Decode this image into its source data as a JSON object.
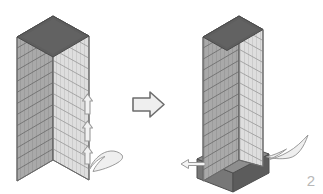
{
  "figure": {
    "label": "2",
    "label_color": "#b8b8b8",
    "background": "#ffffff",
    "title": ""
  },
  "palette": {
    "roof_dark": "#5e5e5e",
    "roof_dark_edge": "#4a4a4a",
    "face_left": "#a9a9a9",
    "face_right": "#dedede",
    "face_left_line": "#7d7d7d",
    "face_right_line": "#b4b4b4",
    "outline": "#6b6b6b",
    "podium_top": "#8e8e8e",
    "podium_left": "#777777",
    "podium_right": "#5c5c5c",
    "arrow_fill": "#f2f2f2",
    "arrow_stroke": "#9a9a9a",
    "big_arrow_fill": "#efefef",
    "big_arrow_stroke": "#6e6e6e"
  },
  "scene": {
    "left_building": {
      "name": "existing-tower",
      "floors": 13,
      "roof_label": "",
      "has_podium": false
    },
    "right_building": {
      "name": "retrofitted-tower",
      "floors": 13,
      "roof_label": "",
      "has_podium": true,
      "podium_label": ""
    },
    "transition_arrow": {
      "name": "transition-arrow",
      "direction": "right",
      "label": ""
    },
    "left_annotations": [
      {
        "name": "up-arrow-upper",
        "direction": "up",
        "label": ""
      },
      {
        "name": "up-arrow-middle",
        "direction": "up",
        "label": ""
      },
      {
        "name": "up-arrow-lower",
        "direction": "up",
        "label": ""
      },
      {
        "name": "curved-load-arrow",
        "direction": "curved-left",
        "label": ""
      }
    ],
    "right_annotations": [
      {
        "name": "lateral-arrow-left",
        "direction": "left",
        "label": ""
      },
      {
        "name": "curved-load-arrow",
        "direction": "curved-left",
        "label": ""
      }
    ]
  }
}
